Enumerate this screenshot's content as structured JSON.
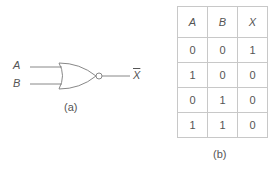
{
  "figure_a": {
    "input_a": "A",
    "input_b": "B",
    "output": "X",
    "gate_type": "NOR",
    "caption": "(a)"
  },
  "figure_b": {
    "headers": [
      "A",
      "B",
      "X"
    ],
    "rows": [
      [
        "0",
        "0",
        "1"
      ],
      [
        "1",
        "0",
        "0"
      ],
      [
        "0",
        "1",
        "0"
      ],
      [
        "1",
        "1",
        "0"
      ]
    ],
    "caption": "(b)"
  }
}
